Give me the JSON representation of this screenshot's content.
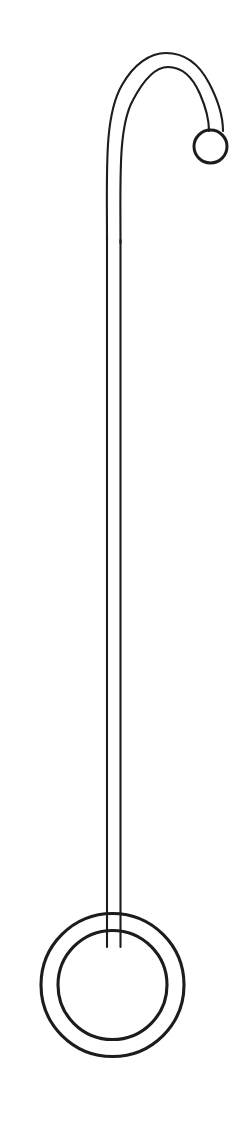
{
  "document": {
    "title": "Line Drawing",
    "kind": "technical-line-illustration",
    "subject": "shepherds-crook-stand-with-ring-base",
    "canvas": {
      "width": 249,
      "height": 1139,
      "background_color": "#ffffff"
    },
    "ink": {
      "stroke_color": "#1c1c1c",
      "thin_stroke_width": 2.1,
      "thick_stroke_width": 3.1
    }
  },
  "figure": {
    "label": "shepherds-crook-outline",
    "parts": [
      {
        "name": "hook-arc",
        "label": "Curved hook at top"
      },
      {
        "name": "vertical-shaft",
        "label": "Long straight shaft"
      },
      {
        "name": "small-ring",
        "label": "Small ring at hook tip"
      },
      {
        "name": "base-ring",
        "label": "Large double ring at base"
      }
    ],
    "geometry": {
      "hook": {
        "outer_path": "M 107 1139 L 107 236 C 107 128 125 62 165 54 C 205 46 223 96 223 130",
        "inner_path": "M 120.5 1139 L 120.5 240 C 120.5 140 136 74 166 67 C 196 60 209 98 209 130"
      },
      "shaft": {
        "left_x": 107,
        "right_x": 120.5,
        "top_y": 236,
        "bottom_y": 947
      },
      "small_ring": {
        "cx": 210.5,
        "cy": 146.5,
        "r": 16.5
      },
      "base_ring": {
        "cx": 112.5,
        "cy": 985,
        "outer_r": 71.5,
        "inner_r": 54.5
      }
    }
  }
}
